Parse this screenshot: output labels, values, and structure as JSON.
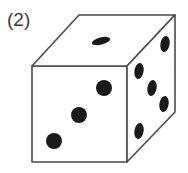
{
  "figure": {
    "label": "(2)",
    "caption_text": "(2)",
    "object_name": "die",
    "background_color": "#ffffff",
    "edge_color": "#4a4a4a",
    "face_fill_color": "#ffffff",
    "pip_color": "#1a1a1a",
    "edge_width": 1.6
  },
  "cube": {
    "projection": "oblique-cabinet",
    "vertices": {
      "front_top_left": [
        32,
        66
      ],
      "front_top_right": [
        127,
        66
      ],
      "front_bottom_right": [
        127,
        162
      ],
      "front_bottom_left": [
        32,
        162
      ],
      "back_top_left": [
        79,
        15
      ],
      "back_top_right": [
        175,
        15
      ],
      "back_bottom_right": [
        175,
        112
      ]
    },
    "faces": [
      {
        "name": "front-face",
        "value": 3,
        "polygon": "32,66 127,66 127,162 32,162",
        "pips": [
          {
            "cx": 104,
            "cy": 88,
            "rx": 8.0,
            "ry": 8.0,
            "rot": 0
          },
          {
            "cx": 79,
            "cy": 115,
            "rx": 8.0,
            "ry": 8.0,
            "rot": 0
          },
          {
            "cx": 54,
            "cy": 141,
            "rx": 8.0,
            "ry": 8.0,
            "rot": 0
          }
        ]
      },
      {
        "name": "top-face",
        "value": 1,
        "polygon": "32,66 79,15 175,15 127,66",
        "pips": [
          {
            "cx": 101,
            "cy": 41,
            "rx": 9.5,
            "ry": 3.6,
            "rot": -14
          }
        ]
      },
      {
        "name": "right-face",
        "value": 5,
        "polygon": "127,66 175,15 175,112 127,162",
        "pips": [
          {
            "cx": 165,
            "cy": 44,
            "rx": 4.6,
            "ry": 8.0,
            "rot": 10
          },
          {
            "cx": 139,
            "cy": 71,
            "rx": 4.6,
            "ry": 8.0,
            "rot": 10
          },
          {
            "cx": 152,
            "cy": 88,
            "rx": 4.6,
            "ry": 8.0,
            "rot": 10
          },
          {
            "cx": 164,
            "cy": 104,
            "rx": 4.6,
            "ry": 8.0,
            "rot": 10
          },
          {
            "cx": 139,
            "cy": 131,
            "rx": 4.6,
            "ry": 8.0,
            "rot": 10
          }
        ]
      }
    ]
  }
}
